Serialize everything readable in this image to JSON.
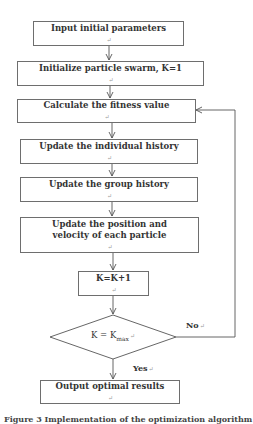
{
  "flowchart": {
    "steps": [
      {
        "id": "input",
        "label": "Input initial parameters"
      },
      {
        "id": "init",
        "label": "Initialize particle swarm, K=1"
      },
      {
        "id": "fitness",
        "label": "Calculate the fitness value"
      },
      {
        "id": "individual",
        "label": "Update the individual history"
      },
      {
        "id": "group",
        "label": "Update the group history"
      },
      {
        "id": "position",
        "label": "Update the position and velocity of each particle"
      },
      {
        "id": "increment",
        "label": "K=K+1"
      },
      {
        "id": "output",
        "label": "Output optimal results"
      }
    ],
    "decision": {
      "lhs": "K = K",
      "subscript": "max",
      "yes_label": "Yes",
      "no_label": "No"
    },
    "return_mark": "↵"
  },
  "caption": "Figure 3   Implementation of the optimization algorithm"
}
